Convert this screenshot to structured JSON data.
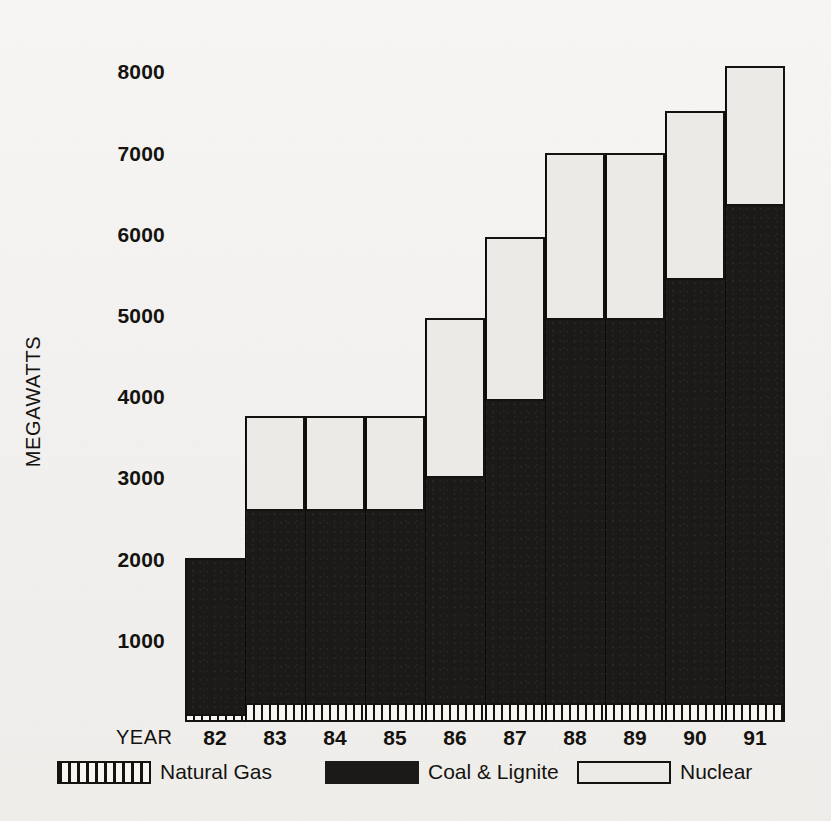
{
  "axis": {
    "ylabel": "MEGAWATTS",
    "xlabel": "YEAR",
    "yticks": [
      "8000",
      "7000",
      "6000",
      "5000",
      "4000",
      "3000",
      "2000",
      "1000"
    ],
    "ytick_values": [
      8000,
      7000,
      6000,
      5000,
      4000,
      3000,
      2000,
      1000
    ]
  },
  "legend": {
    "items": [
      {
        "label": "Natural Gas",
        "swatch": "hatched-vertical-stripes",
        "color": "#15130f"
      },
      {
        "label": "Coal & Lignite",
        "swatch": "solid-black",
        "color": "#1b1a18"
      },
      {
        "label": "Nuclear",
        "swatch": "outlined-white",
        "color": "#edebe7"
      }
    ]
  },
  "chart_data": {
    "type": "bar",
    "title": "",
    "subtitle": "",
    "xlabel": "YEAR",
    "ylabel": "MEGAWATTS",
    "stacked": true,
    "grid": false,
    "legend_position": "bottom",
    "ylim": [
      0,
      8400
    ],
    "yticks": [
      1000,
      2000,
      3000,
      4000,
      5000,
      6000,
      7000,
      8000
    ],
    "categories": [
      "82",
      "83",
      "84",
      "85",
      "86",
      "87",
      "88",
      "89",
      "90",
      "91"
    ],
    "series": [
      {
        "name": "Natural Gas",
        "color": "#15130f",
        "values": [
          100,
          230,
          230,
          230,
          230,
          230,
          230,
          230,
          230,
          230
        ]
      },
      {
        "name": "Coal & Lignite",
        "color": "#1b1a18",
        "values": [
          1920,
          2370,
          2370,
          2370,
          2770,
          3720,
          4720,
          4720,
          5220,
          6120
        ]
      },
      {
        "name": "Nuclear",
        "color": "#edebe7",
        "values": [
          0,
          1150,
          1150,
          1150,
          1950,
          2000,
          2030,
          2030,
          2050,
          1700
        ]
      }
    ],
    "totals": [
      2020,
      3750,
      3750,
      3750,
      4950,
      5950,
      6980,
      6980,
      7500,
      8050
    ]
  }
}
